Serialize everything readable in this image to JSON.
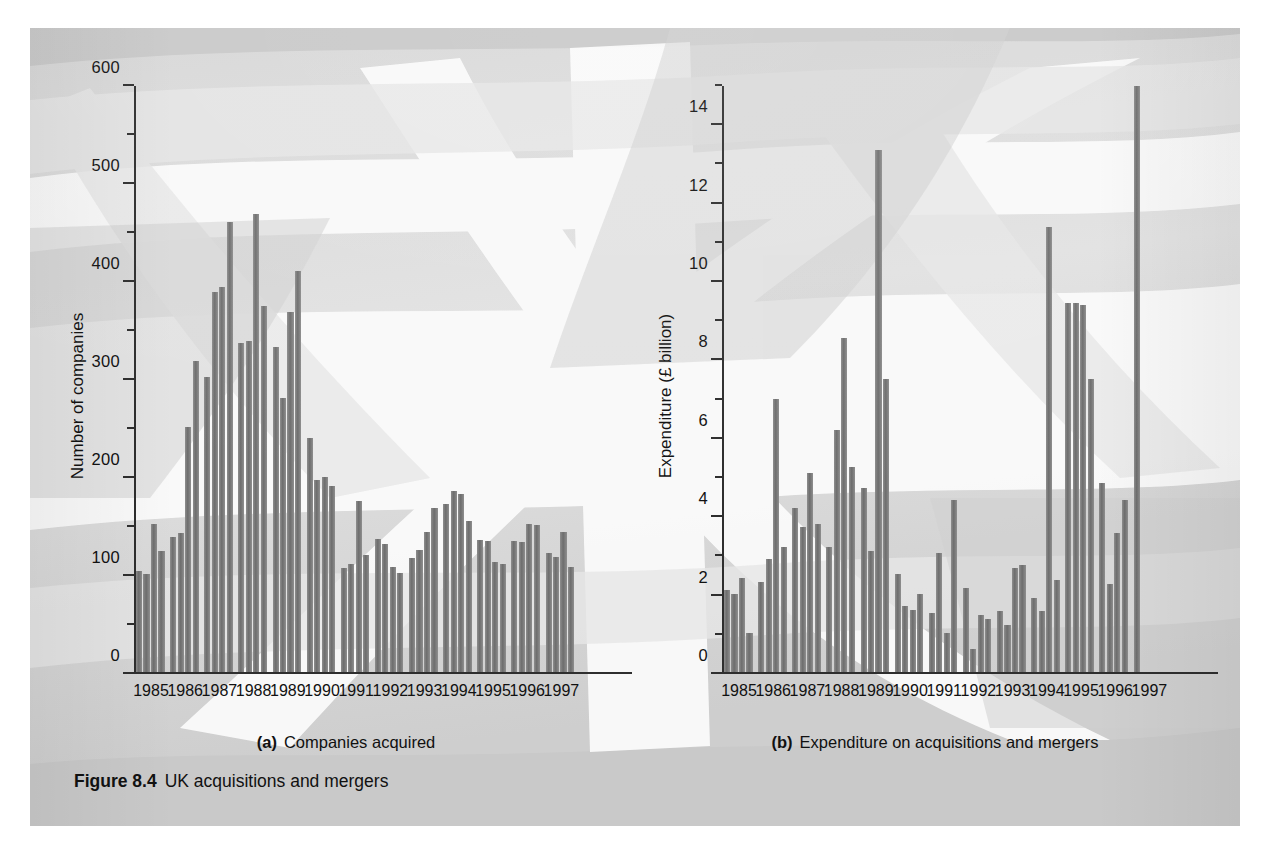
{
  "figure": {
    "number_label": "Figure 8.4",
    "title": "UK acquisitions and mergers",
    "panel_color": "#c9c9c9",
    "bar_color": "#7a7a7a",
    "axis_color": "#2e2e2e"
  },
  "panels": [
    {
      "letter": "(a)",
      "caption": "Companies acquired"
    },
    {
      "letter": "(b)",
      "caption": "Expenditure on acquisitions and mergers"
    }
  ],
  "years": [
    "1985",
    "1986",
    "1987",
    "1988",
    "1989",
    "1990",
    "1991",
    "1992",
    "1993",
    "1994",
    "1995",
    "1996",
    "1997"
  ],
  "chart_data": [
    {
      "id": "companies-acquired",
      "type": "bar",
      "title": "Companies acquired",
      "panel_letter": "(a)",
      "xlabel": "",
      "ylabel": "Number of companies",
      "ylim": [
        0,
        600
      ],
      "ymajor_step": 100,
      "yminor_step": 50,
      "ytick_labels": [
        "0",
        "100",
        "200",
        "300",
        "400",
        "500",
        "600"
      ],
      "grid": false,
      "legend": "none",
      "x_tick_labels": [
        "1985",
        "1986",
        "1987",
        "1988",
        "1989",
        "1990",
        "1991",
        "1992",
        "1993",
        "1994",
        "1995",
        "1996",
        "1997"
      ],
      "frequency": "quarterly",
      "categories": [
        "1985 Q1",
        "1985 Q2",
        "1985 Q3",
        "1985 Q4",
        "1986 Q1",
        "1986 Q2",
        "1986 Q3",
        "1986 Q4",
        "1987 Q1",
        "1987 Q2",
        "1987 Q3",
        "1987 Q4",
        "1988 Q1",
        "1988 Q2",
        "1988 Q3",
        "1988 Q4",
        "1989 Q1",
        "1989 Q2",
        "1989 Q3",
        "1989 Q4",
        "1990 Q1",
        "1990 Q2",
        "1990 Q3",
        "1990 Q4",
        "1991 Q1",
        "1991 Q2",
        "1991 Q3",
        "1991 Q4",
        "1992 Q1",
        "1992 Q2",
        "1992 Q3",
        "1992 Q4",
        "1993 Q1",
        "1993 Q2",
        "1993 Q3",
        "1993 Q4",
        "1994 Q1",
        "1994 Q2",
        "1994 Q3",
        "1994 Q4",
        "1995 Q1",
        "1995 Q2",
        "1995 Q3",
        "1995 Q4",
        "1996 Q1",
        "1996 Q2",
        "1996 Q3",
        "1996 Q4",
        "1997 Q1",
        "1997 Q2",
        "1997 Q3",
        "1997 Q4"
      ],
      "values": [
        103,
        100,
        152,
        124,
        138,
        142,
        251,
        318,
        302,
        389,
        394,
        461,
        337,
        339,
        469,
        375,
        333,
        281,
        369,
        411,
        240,
        197,
        200,
        190,
        107,
        111,
        175,
        120,
        136,
        131,
        108,
        101,
        117,
        125,
        143,
        168,
        172,
        185,
        182,
        155,
        135,
        134,
        113,
        111,
        134,
        133,
        152,
        151,
        122,
        118,
        143,
        108
      ]
    },
    {
      "id": "expenditure-on-acquisitions-and-mergers",
      "type": "bar",
      "title": "Expenditure on acquisitions and mergers",
      "panel_letter": "(b)",
      "xlabel": "",
      "ylabel": "Expenditure (£ billion)",
      "ylim": [
        0,
        15
      ],
      "ymajor_step": 2,
      "yminor_step": 1,
      "ytick_labels": [
        "0",
        "2",
        "4",
        "6",
        "8",
        "10",
        "12",
        "14"
      ],
      "grid": false,
      "legend": "none",
      "units": "£ billion",
      "x_tick_labels": [
        "1985",
        "1986",
        "1987",
        "1988",
        "1989",
        "1990",
        "1991",
        "1992",
        "1993",
        "1994",
        "1995",
        "1996",
        "1997"
      ],
      "frequency": "quarterly",
      "categories": [
        "1985 Q1",
        "1985 Q2",
        "1985 Q3",
        "1985 Q4",
        "1986 Q1",
        "1986 Q2",
        "1986 Q3",
        "1986 Q4",
        "1987 Q1",
        "1987 Q2",
        "1987 Q3",
        "1987 Q4",
        "1988 Q1",
        "1988 Q2",
        "1988 Q3",
        "1988 Q4",
        "1989 Q1",
        "1989 Q2",
        "1989 Q3",
        "1989 Q4",
        "1990 Q1",
        "1990 Q2",
        "1990 Q3",
        "1990 Q4",
        "1991 Q1",
        "1991 Q2",
        "1991 Q3",
        "1991 Q4",
        "1992 Q1",
        "1992 Q2",
        "1992 Q3",
        "1992 Q4",
        "1993 Q1",
        "1993 Q2",
        "1993 Q3",
        "1993 Q4",
        "1994 Q1",
        "1994 Q2",
        "1994 Q3",
        "1994 Q4",
        "1995 Q1",
        "1995 Q2",
        "1995 Q3",
        "1995 Q4",
        "1996 Q1",
        "1996 Q2",
        "1996 Q3",
        "1996 Q4",
        "1997 Q1",
        "1997 Q2",
        "1997 Q3",
        "1997 Q4"
      ],
      "values": [
        2.1,
        2.0,
        2.4,
        1.0,
        2.3,
        2.9,
        7.0,
        3.2,
        4.2,
        3.7,
        5.1,
        3.8,
        3.2,
        6.2,
        8.55,
        5.25,
        4.7,
        3.1,
        13.35,
        7.5,
        2.5,
        1.7,
        1.6,
        2.0,
        1.5,
        3.05,
        1.0,
        4.4,
        2.15,
        0.6,
        1.45,
        1.35,
        1.55,
        1.2,
        2.65,
        2.75,
        1.9,
        1.55,
        11.4,
        2.35,
        9.45,
        9.45,
        9.4,
        7.5,
        4.85,
        2.25,
        3.55,
        4.4,
        15.0,
        0,
        0,
        0
      ]
    }
  ]
}
